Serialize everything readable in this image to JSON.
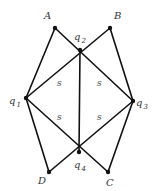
{
  "diagram": {
    "nodes": [
      {
        "id": "A",
        "label": "A",
        "sub": "",
        "x": 55,
        "y": 28,
        "lx": 44,
        "ly": 19
      },
      {
        "id": "B",
        "label": "B",
        "sub": "",
        "x": 110,
        "y": 28,
        "lx": 114,
        "ly": 19
      },
      {
        "id": "q2",
        "label": "q",
        "sub": "2",
        "x": 80,
        "y": 50,
        "lx": 74,
        "ly": 40
      },
      {
        "id": "q1",
        "label": "q",
        "sub": "1",
        "x": 26,
        "y": 98,
        "lx": 9,
        "ly": 104
      },
      {
        "id": "q3",
        "label": "q",
        "sub": "3",
        "x": 133,
        "y": 101,
        "lx": 136,
        "ly": 106
      },
      {
        "id": "q4",
        "label": "q",
        "sub": "4",
        "x": 79,
        "y": 152,
        "lx": 74,
        "ly": 168
      },
      {
        "id": "D",
        "label": "D",
        "sub": "",
        "x": 49,
        "y": 172,
        "lx": 38,
        "ly": 184
      },
      {
        "id": "C",
        "label": "C",
        "sub": "",
        "x": 108,
        "y": 172,
        "lx": 106,
        "ly": 186
      }
    ],
    "edges": [
      [
        "A",
        "q1"
      ],
      [
        "A",
        "q3"
      ],
      [
        "B",
        "q1"
      ],
      [
        "B",
        "q3"
      ],
      [
        "q2",
        "q4"
      ],
      [
        "q1",
        "D"
      ],
      [
        "q1",
        "C"
      ],
      [
        "q3",
        "D"
      ],
      [
        "q3",
        "C"
      ]
    ],
    "face_labels": [
      {
        "text": "s",
        "x": 57,
        "y": 86
      },
      {
        "text": "s",
        "x": 97,
        "y": 86
      },
      {
        "text": "s",
        "x": 57,
        "y": 120
      },
      {
        "text": "s",
        "x": 97,
        "y": 120
      }
    ]
  }
}
